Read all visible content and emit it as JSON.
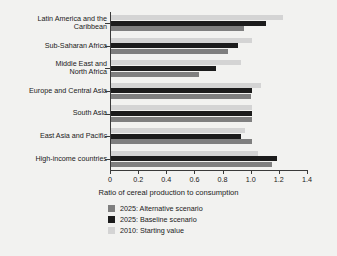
{
  "chart_data": {
    "type": "bar",
    "orientation": "horizontal",
    "title": "",
    "xlabel": "Ratio of cereal production to consumption",
    "ylabel": "",
    "xlim": [
      0,
      1.4
    ],
    "xticks": [
      "0",
      "0.2",
      "0.4",
      "0.6",
      "0.8",
      "1.0",
      "1.2",
      "1.4"
    ],
    "xtick_values": [
      0,
      0.2,
      0.4,
      0.6,
      0.8,
      1.0,
      1.2,
      1.4
    ],
    "grid": false,
    "legend_position": "below-axis-left",
    "categories": [
      "Latin America and the\nCaribbean",
      "Sub-Saharan Africa",
      "Middle East and\nNorth Africa",
      "Europe and Central Asia",
      "South Asia",
      "East Asia and Pacific",
      "High-income countries"
    ],
    "series": [
      {
        "name": "2010: Starting value",
        "color": "#d4d4d4",
        "values": [
          1.23,
          1.01,
          0.93,
          1.07,
          1.01,
          0.96,
          1.05
        ]
      },
      {
        "name": "2025: Baseline scenario",
        "color": "#1c1c1c",
        "values": [
          1.11,
          0.91,
          0.75,
          1.01,
          1.01,
          0.93,
          1.19
        ]
      },
      {
        "name": "2025: Alternative scenario",
        "color": "#7f7f7f",
        "values": [
          0.95,
          0.84,
          0.63,
          1.0,
          1.01,
          1.01,
          1.15
        ]
      }
    ],
    "legend": [
      {
        "label": "2025: Alternative scenario",
        "color": "#7f7f7f"
      },
      {
        "label": "2025: Baseline scenario",
        "color": "#1c1c1c"
      },
      {
        "label": "2010: Starting value",
        "color": "#d4d4d4"
      }
    ]
  }
}
